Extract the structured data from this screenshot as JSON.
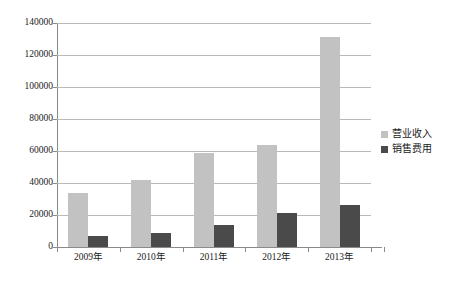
{
  "chart_data": {
    "type": "bar",
    "title": "",
    "subtitle": "",
    "xlabel": "",
    "ylabel": "",
    "categories": [
      "2009年",
      "2010年",
      "2011年",
      "2012年",
      "2013年"
    ],
    "series": [
      {
        "name": "营业收入",
        "color": "#c2c2c2",
        "values": [
          34000,
          42000,
          58500,
          64000,
          131000
        ]
      },
      {
        "name": "销售费用",
        "color": "#4a4a4a",
        "values": [
          7000,
          9000,
          14000,
          21000,
          26000
        ]
      }
    ],
    "ylim": [
      0,
      140000
    ],
    "ytick_values": [
      0,
      20000,
      40000,
      60000,
      80000,
      100000,
      120000,
      140000
    ],
    "ytick_labels": [
      "0",
      "20000",
      "40000",
      "60000",
      "80000",
      "100000",
      "120000",
      "140000"
    ],
    "grid": "horizontal",
    "legend_position": "right",
    "legend_entries": [
      "营业收入",
      "销售费用"
    ],
    "annotations": [],
    "background_color": "#ffffff",
    "gridline_color": "#b9b9b9",
    "axis_color": "#8a8a8a"
  }
}
